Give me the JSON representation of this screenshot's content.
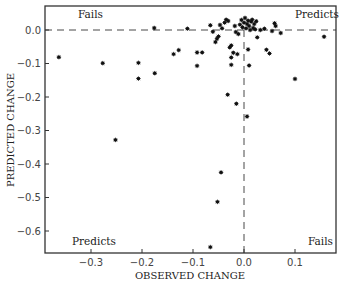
{
  "chart_data": {
    "type": "scatter",
    "title": "",
    "xlabel": "OBSERVED CHANGE",
    "ylabel": "PREDICTED CHANGE",
    "xlim": [
      -0.39,
      0.18
    ],
    "ylim": [
      -0.67,
      0.07
    ],
    "grid": false,
    "legend": null,
    "x_ticks": [
      -0.3,
      -0.2,
      -0.1,
      0.0,
      0.1
    ],
    "x_tick_labels": [
      "−0.3",
      "−0.2",
      "−0.1",
      "0.0",
      "0.1"
    ],
    "y_ticks": [
      0.0,
      -0.1,
      -0.2,
      -0.3,
      -0.4,
      -0.5,
      -0.6
    ],
    "y_tick_labels": [
      "0.0",
      "−0.1",
      "−0.2",
      "−0.3",
      "−0.4",
      "−0.5",
      "−0.6"
    ],
    "reference_lines": [
      {
        "type": "horizontal",
        "y": 0.0,
        "style": "dashed"
      },
      {
        "type": "vertical",
        "x": 0.0,
        "style": "dashed"
      }
    ],
    "annotations": [
      {
        "text": "Fails",
        "position": "top-left"
      },
      {
        "text": "Predicts",
        "position": "top-right"
      },
      {
        "text": "Predicts",
        "position": "bottom-left"
      },
      {
        "text": "Fails",
        "position": "bottom-right"
      }
    ],
    "series": [
      {
        "name": "points",
        "marker": "star",
        "points": [
          [
            -0.363,
            -0.081
          ],
          [
            -0.277,
            -0.099
          ],
          [
            -0.252,
            -0.328
          ],
          [
            -0.207,
            -0.098
          ],
          [
            -0.207,
            -0.145
          ],
          [
            -0.175,
            -0.129
          ],
          [
            -0.176,
            0.006
          ],
          [
            -0.138,
            -0.072
          ],
          [
            -0.128,
            -0.06
          ],
          [
            -0.111,
            0.004
          ],
          [
            -0.092,
            -0.067
          ],
          [
            -0.082,
            -0.067
          ],
          [
            -0.092,
            -0.107
          ],
          [
            -0.066,
            0.014
          ],
          [
            -0.061,
            -0.005
          ],
          [
            -0.056,
            -0.036
          ],
          [
            -0.053,
            -0.026
          ],
          [
            -0.05,
            -0.019
          ],
          [
            -0.047,
            0.015
          ],
          [
            -0.043,
            0.005
          ],
          [
            -0.038,
            0.022
          ],
          [
            -0.035,
            0.031
          ],
          [
            -0.031,
            0.027
          ],
          [
            -0.028,
            -0.052
          ],
          [
            -0.025,
            -0.046
          ],
          [
            -0.025,
            -0.082
          ],
          [
            -0.021,
            -0.068
          ],
          [
            -0.018,
            0.012
          ],
          [
            -0.016,
            -0.006
          ],
          [
            -0.013,
            -0.072
          ],
          [
            -0.011,
            -0.012
          ],
          [
            -0.025,
            -0.104
          ],
          [
            -0.032,
            -0.193
          ],
          [
            -0.015,
            -0.22
          ],
          [
            0.006,
            -0.258
          ],
          [
            -0.008,
            0.016
          ],
          [
            -0.005,
            0.03
          ],
          [
            -0.003,
            0.008
          ],
          [
            0.0,
            0.022
          ],
          [
            0.002,
            0.036
          ],
          [
            0.004,
            0.005
          ],
          [
            0.006,
            0.018
          ],
          [
            0.008,
            0.028
          ],
          [
            0.01,
            0.012
          ],
          [
            0.012,
            0.0
          ],
          [
            0.014,
            0.025
          ],
          [
            0.016,
            0.031
          ],
          [
            0.018,
            0.006
          ],
          [
            0.02,
            0.018
          ],
          [
            0.022,
            0.002
          ],
          [
            0.024,
            0.026
          ],
          [
            0.008,
            -0.058
          ],
          [
            0.01,
            -0.106
          ],
          [
            0.026,
            -0.022
          ],
          [
            0.032,
            0.0
          ],
          [
            0.04,
            0.004
          ],
          [
            0.044,
            -0.059
          ],
          [
            0.05,
            -0.07
          ],
          [
            0.055,
            -0.003
          ],
          [
            0.06,
            0.02
          ],
          [
            0.062,
            0.012
          ],
          [
            0.072,
            -0.009
          ],
          [
            -0.045,
            -0.425
          ],
          [
            -0.052,
            -0.513
          ],
          [
            -0.066,
            -0.648
          ],
          [
            0.1,
            -0.146
          ],
          [
            0.157,
            -0.02
          ]
        ]
      }
    ]
  }
}
